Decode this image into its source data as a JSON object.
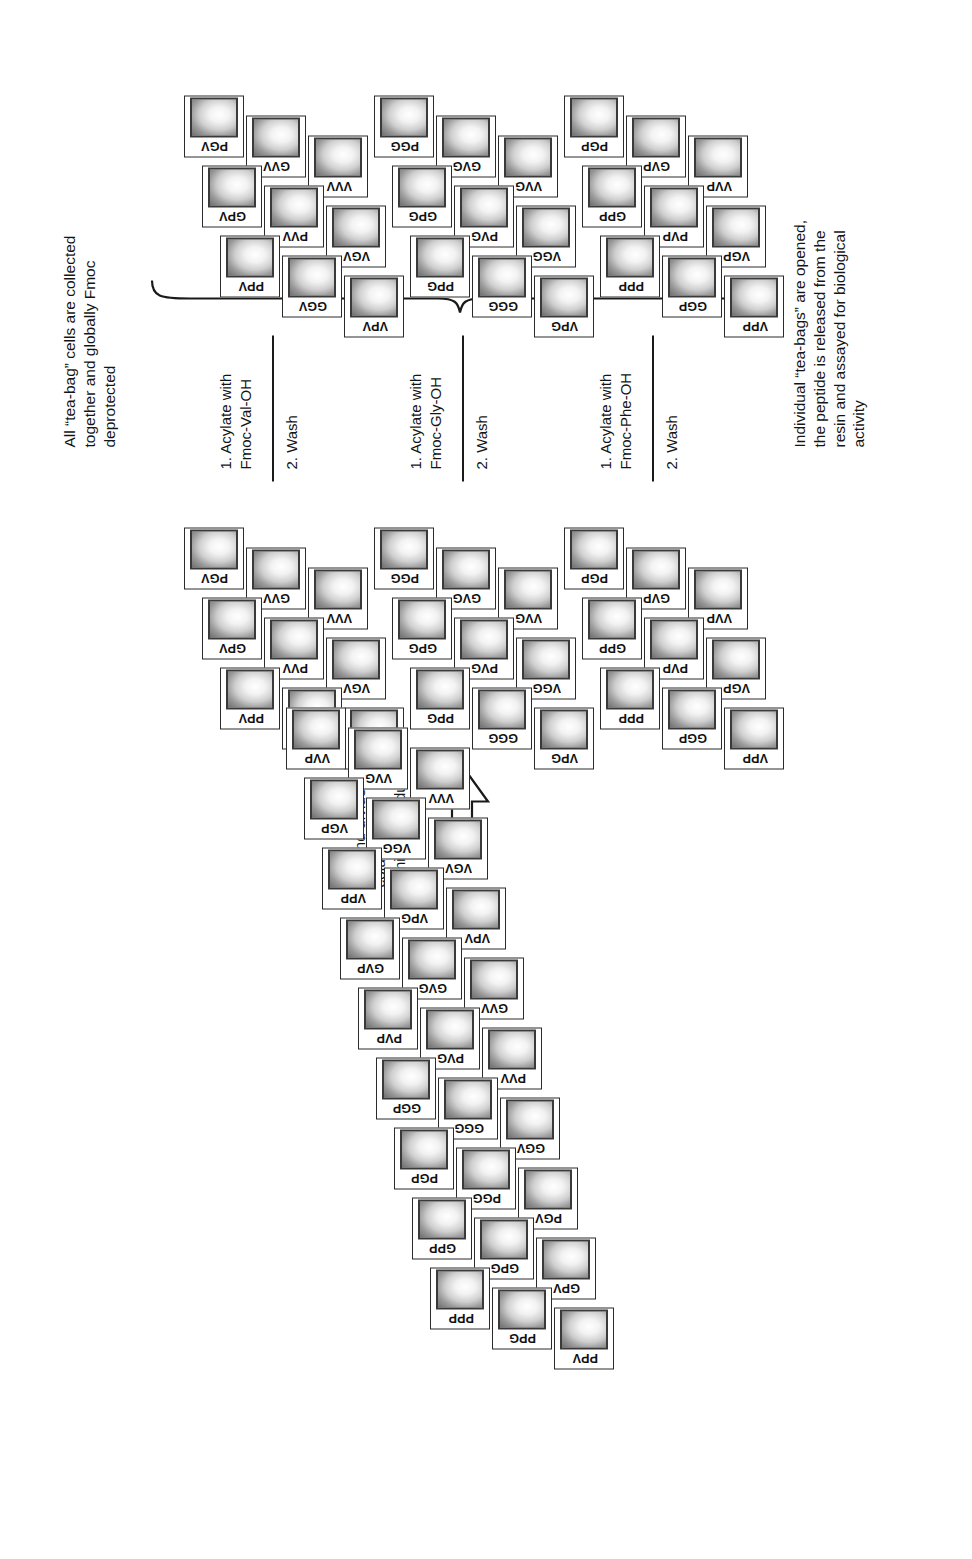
{
  "figure": {
    "type": "tea-bag split-and-mix peptide synthesis scheme",
    "residues": [
      "P",
      "G",
      "V"
    ],
    "caption_present": false
  },
  "annotations": {
    "cut_divide": "Cut and divide into three columns\nof nine individual cells",
    "collect_deprotect": "All “tea-bag” cells are collected\ntogether and globally Fmoc\ndeprotected",
    "assay": "Individual “tea-bags” are opened,\nthe peptide is released from the\nresin and assayed for biological\nactivity"
  },
  "steps": [
    {
      "line1": "1. Acylate with",
      "line2": "Fmoc-Phe-OH",
      "line3": "2. Wash"
    },
    {
      "line1": "1. Acylate with",
      "line2": "Fmoc-Gly-OH",
      "line3": "2. Wash"
    },
    {
      "line1": "1. Acylate with",
      "line2": "Fmoc-Val-OH",
      "line3": "2. Wash"
    }
  ],
  "source_grid": {
    "title": "combined 27-cell block",
    "rows": [
      [
        "PPP",
        "GPP",
        "PGP",
        "GGP",
        "PVP",
        "GVP",
        "VPP",
        "VGP",
        "VVP"
      ],
      [
        "PPG",
        "GPG",
        "PGG",
        "GGG",
        "PVG",
        "GVG",
        "VPG",
        "VGG",
        "VVG"
      ],
      [
        "PPV",
        "GPV",
        "PGV",
        "GGV",
        "PVV",
        "GVV",
        "VPV",
        "VGV",
        "VVV"
      ]
    ]
  },
  "middle_grids": [
    {
      "name": "column-P",
      "rows": [
        [
          "PPP",
          "GPP",
          "PGP"
        ],
        [
          "GGP",
          "PVP",
          "GVP"
        ],
        [
          "VPP",
          "VGP",
          "VVP"
        ]
      ]
    },
    {
      "name": "column-G",
      "rows": [
        [
          "PPG",
          "GPG",
          "PGG"
        ],
        [
          "GGG",
          "PVG",
          "GVG"
        ],
        [
          "VPG",
          "VGG",
          "VVG"
        ]
      ]
    },
    {
      "name": "column-V",
      "rows": [
        [
          "PPV",
          "GPV",
          "PGV"
        ],
        [
          "GGV",
          "PVV",
          "GVV"
        ],
        [
          "VPV",
          "VGV",
          "VVV"
        ]
      ]
    }
  ],
  "result_grids": [
    {
      "name": "product-P",
      "rows": [
        [
          "PPP",
          "GPP",
          "PGP"
        ],
        [
          "GGP",
          "PVP",
          "GVP"
        ],
        [
          "VPP",
          "VGP",
          "VVP"
        ]
      ]
    },
    {
      "name": "product-G",
      "rows": [
        [
          "PPG",
          "GPG",
          "PGG"
        ],
        [
          "GGG",
          "PVG",
          "GVG"
        ],
        [
          "VPG",
          "VGG",
          "VVG"
        ]
      ]
    },
    {
      "name": "product-V",
      "rows": [
        [
          "PPV",
          "GPV",
          "PGV"
        ],
        [
          "GGV",
          "PVV",
          "GVV"
        ],
        [
          "VPV",
          "VGV",
          "VVV"
        ]
      ]
    }
  ],
  "colors": {
    "ink": "#1a1a1a",
    "cell_border": "#2b2b2b",
    "bag_fill_light": "#ffffff",
    "bag_fill_dark": "#6e6e6e",
    "background": "#ffffff"
  }
}
